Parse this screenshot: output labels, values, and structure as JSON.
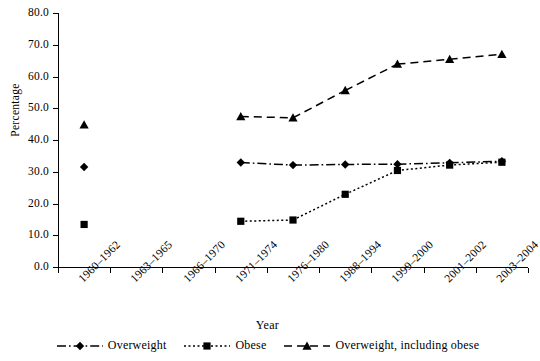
{
  "chart_data": {
    "type": "line",
    "title": "",
    "xlabel": "Year",
    "ylabel": "Percentage",
    "ylim": [
      0,
      80
    ],
    "ytick_step": 10,
    "ytick_labels": [
      "0.0",
      "10.0",
      "20.0",
      "30.0",
      "40.0",
      "50.0",
      "60.0",
      "70.0",
      "80.0"
    ],
    "grid": false,
    "legend_position": "bottom",
    "categories": [
      "1960–1962",
      "1963–1965",
      "1966–1970",
      "1971–1974",
      "1976–1980",
      "1988–1994",
      "1999–2000",
      "2001–2002",
      "2003–2004"
    ],
    "series": [
      {
        "name": "Overweight",
        "marker": "diamond",
        "line_style": "dash-dot",
        "color": "#000000",
        "values": [
          31.5,
          null,
          null,
          32.9,
          32.1,
          32.3,
          32.4,
          32.8,
          33.3
        ]
      },
      {
        "name": "Obese",
        "marker": "square",
        "line_style": "dotted",
        "color": "#000000",
        "values": [
          13.4,
          null,
          null,
          14.4,
          14.8,
          22.9,
          30.4,
          32.1,
          33.0
        ]
      },
      {
        "name": "Overweight, including obese",
        "marker": "triangle",
        "line_style": "dashed",
        "color": "#000000",
        "values": [
          44.8,
          null,
          null,
          47.4,
          47.0,
          55.6,
          63.9,
          65.4,
          67.0
        ]
      }
    ]
  },
  "legend": {
    "items": [
      {
        "label": "Overweight",
        "marker": "diamond-icon",
        "line_style": "dash-dot"
      },
      {
        "label": "Obese",
        "marker": "square-icon",
        "line_style": "dotted"
      },
      {
        "label": "Overweight, including obese",
        "marker": "triangle-icon",
        "line_style": "dashed"
      }
    ]
  }
}
